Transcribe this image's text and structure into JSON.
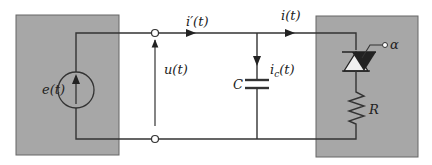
{
  "diagram": {
    "type": "circuit",
    "source_block": {
      "label": "e(t)",
      "element": "voltage-source",
      "color": "#a7a7a7"
    },
    "load_block": {
      "elements": [
        "thyristor",
        "resistor"
      ],
      "thyristor_gate_label": "α",
      "resistor_label": "R",
      "color": "#a7a7a7"
    },
    "labels": {
      "source_current": "i′(t)",
      "load_current": "i(t)",
      "terminal_voltage": "u(t)",
      "capacitor": "C",
      "capacitor_current_main": "i",
      "capacitor_current_sub": "c",
      "capacitor_current_suffix": "(t)",
      "source_voltage": "e(t)",
      "gate": "α",
      "resistor": "R"
    }
  }
}
